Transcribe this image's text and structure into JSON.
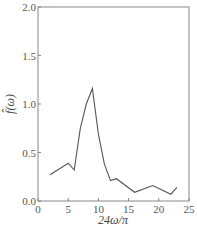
{
  "chart_data": {
    "type": "line",
    "title": "",
    "xlabel": "24ω/π",
    "ylabel": "f̂(ω)",
    "xlim": [
      0,
      25
    ],
    "ylim": [
      0,
      2.0
    ],
    "xticks": [
      0,
      5,
      10,
      15,
      20,
      25
    ],
    "yticks": [
      0.0,
      0.5,
      1.0,
      1.5,
      2.0
    ],
    "xtick_labels": [
      "0",
      "5",
      "10",
      "15",
      "20",
      "25"
    ],
    "ytick_labels": [
      "0.0",
      "0.5",
      "1.0",
      "1.5",
      "2.0"
    ],
    "grid": false,
    "legend": null,
    "series": [
      {
        "name": "f̂(ω)",
        "x": [
          2,
          5,
          6,
          7,
          8,
          9,
          10,
          11,
          12,
          13,
          16,
          19,
          22,
          23
        ],
        "values": [
          0.27,
          0.39,
          0.32,
          0.75,
          1.0,
          1.16,
          0.69,
          0.38,
          0.21,
          0.23,
          0.09,
          0.16,
          0.07,
          0.14
        ]
      }
    ]
  }
}
